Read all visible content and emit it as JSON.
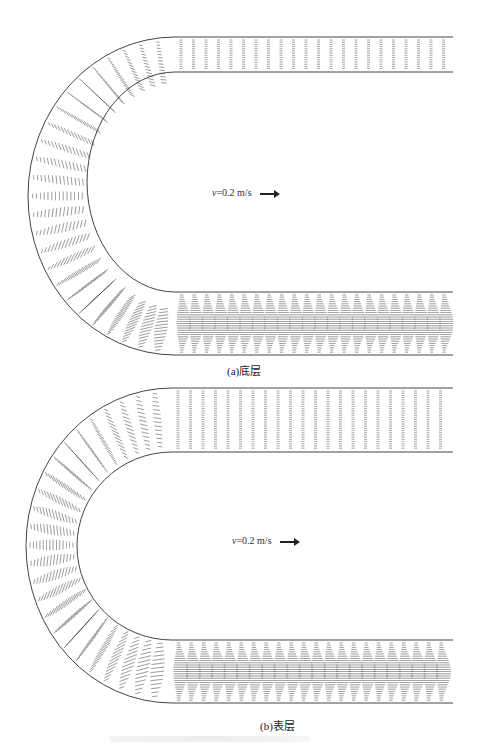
{
  "figure": {
    "panels": [
      {
        "id": "a",
        "caption": "(a)底层",
        "scale_label": {
          "var": "v",
          "text": "=0.2 m/s",
          "arrow": "→"
        },
        "layer": "bottom",
        "vector_color": "#333333",
        "wall_color": "#444444"
      },
      {
        "id": "b",
        "caption": "(b)表层",
        "scale_label": {
          "var": "v",
          "text": "=0.2 m/s",
          "arrow": "→"
        },
        "layer": "surface",
        "vector_color": "#333333",
        "wall_color": "#444444"
      }
    ]
  }
}
